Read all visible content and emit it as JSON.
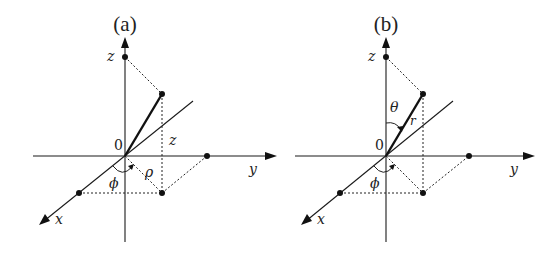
{
  "panels": [
    {
      "id": "a",
      "title": "(a)",
      "labels": {
        "origin": "0",
        "x_axis": "x",
        "y_axis": "y",
        "z_axis": "z",
        "height": "z",
        "radial": "ρ",
        "azimuth": "ϕ"
      },
      "coordinate_system": "cylindrical"
    },
    {
      "id": "b",
      "title": "(b)",
      "labels": {
        "origin": "0",
        "x_axis": "x",
        "y_axis": "y",
        "z_axis": "z",
        "radius": "r",
        "polar": "θ",
        "azimuth": "ϕ"
      },
      "coordinate_system": "spherical"
    }
  ]
}
